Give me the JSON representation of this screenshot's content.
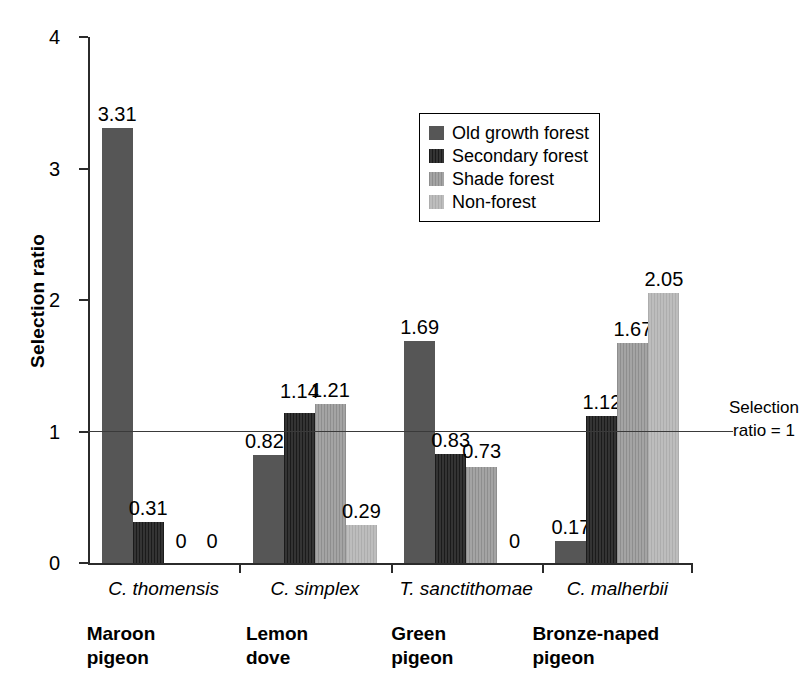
{
  "chart_data": {
    "type": "bar",
    "title": "",
    "xlabel": "",
    "ylabel": "Selection ratio",
    "ylim": [
      0,
      4
    ],
    "yticks": [
      "0",
      "1",
      "2",
      "3",
      "4"
    ],
    "grid": false,
    "legend_position": "upper-center",
    "categories": [
      "C. thomensis",
      "C. simplex",
      "T. sanctithomae",
      "C. malherbii"
    ],
    "category_common_names": [
      "Maroon\npigeon",
      "Lemon\ndove",
      "Green\npigeon",
      "Bronze-naped\npigeon"
    ],
    "series": [
      {
        "name": "Old growth forest",
        "color": "#565656",
        "values": [
          3.31,
          0.82,
          1.69,
          0.17
        ]
      },
      {
        "name": "Secondary forest",
        "color": "#262626",
        "values": [
          0.31,
          1.14,
          0.83,
          1.12
        ]
      },
      {
        "name": "Shade forest",
        "color": "#9a9a9a",
        "values": [
          0,
          1.21,
          0.73,
          1.67
        ]
      },
      {
        "name": "Non-forest",
        "color": "#b6b6b6",
        "values": [
          0,
          0.29,
          0,
          2.05
        ]
      }
    ],
    "data_labels": [
      [
        "3.31",
        "0.31",
        "0",
        "0"
      ],
      [
        "0.82",
        "1.14",
        "1.21",
        "0.29"
      ],
      [
        "1.69",
        "0.83",
        "0.73",
        "0"
      ],
      [
        "0.17",
        "1.12",
        "1.67",
        "2.05"
      ]
    ],
    "annotations": [
      {
        "name": "reference-line",
        "value": 1,
        "text": "Selection\nratio = 1"
      }
    ]
  },
  "axis": {
    "y_title": "Selection ratio",
    "ticks": {
      "t0": "0",
      "t1": "1",
      "t2": "2",
      "t3": "3",
      "t4": "4"
    }
  },
  "legend": {
    "items": [
      {
        "label": "Old growth forest"
      },
      {
        "label": "Secondary forest"
      },
      {
        "label": "Shade forest"
      },
      {
        "label": "Non-forest"
      }
    ]
  },
  "annotation": {
    "reference_text": "Selection\nratio = 1"
  }
}
